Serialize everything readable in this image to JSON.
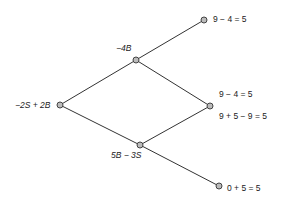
{
  "tree": {
    "root": {
      "label": "−2S + 2B"
    },
    "up": {
      "label": "−4B"
    },
    "down": {
      "label": "5B − 3S"
    },
    "leaf_top": {
      "label": "9 − 4 = 5"
    },
    "leaf_mid": {
      "label_top": "9 − 4 = 5",
      "label_bottom": "9 + 5 − 9 = 5"
    },
    "leaf_bottom": {
      "label": "0 + 5 = 5"
    }
  },
  "colors": {
    "line": "#333333",
    "node_fill": "#bbbbbb",
    "node_stroke": "#444444"
  }
}
